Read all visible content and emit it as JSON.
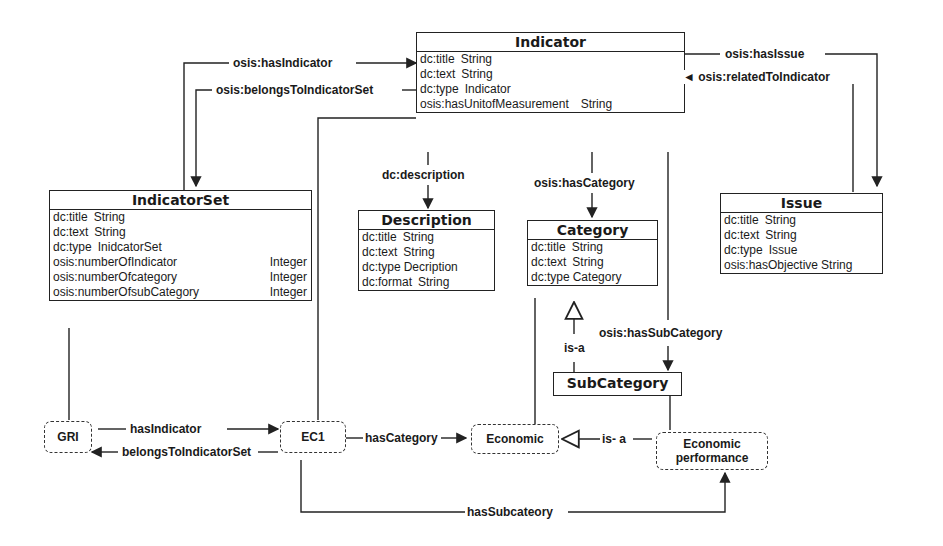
{
  "classes": {
    "indicator": {
      "title": "Indicator",
      "attrs": [
        {
          "name": "dc:title",
          "type": "String"
        },
        {
          "name": "dc:text",
          "type": "String"
        },
        {
          "name": "dc:type",
          "type": "Indicator"
        },
        {
          "name": "osis:hasUnitofMeasurement",
          "type": "String"
        }
      ]
    },
    "indicator_set": {
      "title": "IndicatorSet",
      "attrs": [
        {
          "name": "dc:title",
          "type": "String"
        },
        {
          "name": "dc:text",
          "type": "String"
        },
        {
          "name": "dc:type",
          "type": "InidcatorSet"
        },
        {
          "name": "osis:numberOfIndicator",
          "type": "Integer"
        },
        {
          "name": "osis:numberOfcategory",
          "type": "Integer"
        },
        {
          "name": "osis:numberOfsubCategory",
          "type": "Integer"
        }
      ]
    },
    "description": {
      "title": "Description",
      "attrs": [
        {
          "name": "dc:title",
          "type": "String"
        },
        {
          "name": "dc:text",
          "type": "String"
        },
        {
          "name": "dc:type",
          "type": "Decription"
        },
        {
          "name": "dc:format",
          "type": "String"
        }
      ]
    },
    "category": {
      "title": "Category",
      "attrs": [
        {
          "name": "dc:title",
          "type": "String"
        },
        {
          "name": "dc:text",
          "type": "String"
        },
        {
          "name": "dc:type",
          "type": "Category"
        }
      ]
    },
    "issue": {
      "title": "Issue",
      "attrs": [
        {
          "name": "dc:title",
          "type": "String"
        },
        {
          "name": "dc:text",
          "type": "String"
        },
        {
          "name": "dc:type",
          "type": "Issue"
        },
        {
          "name": "osis:hasObjective",
          "type": "String"
        }
      ]
    },
    "subcategory": {
      "title": "SubCategory"
    }
  },
  "instances": {
    "gri": "GRI",
    "ec1": "EC1",
    "economic": "Economic",
    "economic_performance": "Economic performance"
  },
  "relations": {
    "has_indicator": "osis:hasIndicator",
    "belongs_to_indicator_set": "osis:belongsToIndicatorSet",
    "has_issue": "osis:hasIssue",
    "related_to_indicator": "◄ osis:relatedToIndicator",
    "description": "dc:description",
    "has_category": "osis:hasCategory",
    "has_subcategory": "osis:hasSubCategory",
    "is_a": "is-a",
    "inst_has_indicator": "hasIndicator",
    "inst_belongs_to_indicator_set": "belongsToIndicatorSet",
    "inst_has_category": "hasCategory",
    "inst_is_a": "is- a",
    "inst_has_subcategory": "hasSubcateory"
  }
}
